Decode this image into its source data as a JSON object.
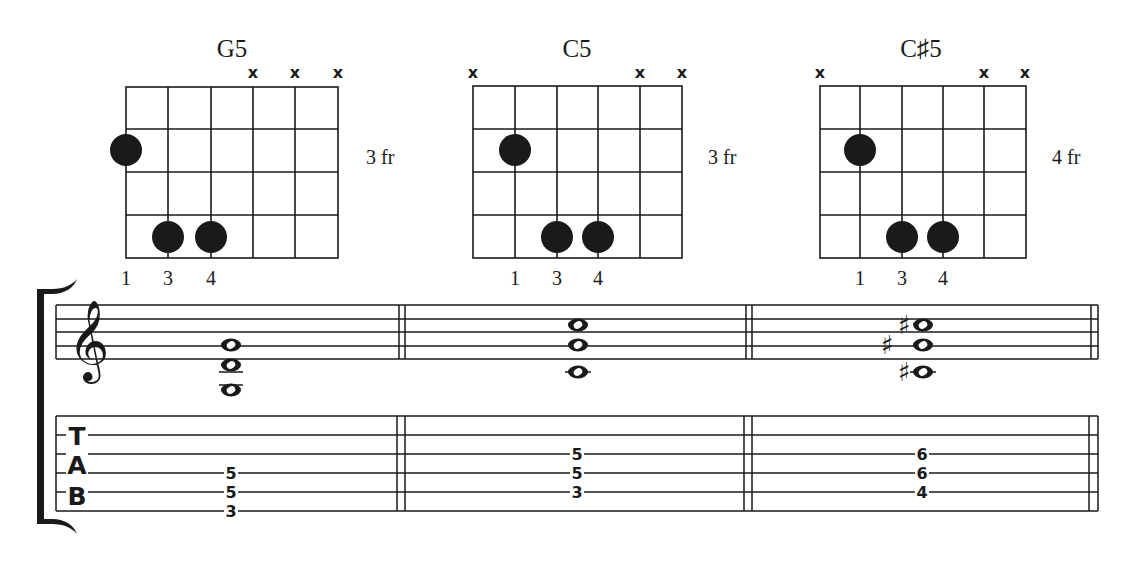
{
  "chords": [
    {
      "name": "G5",
      "fret_label": "3 fr",
      "muted_strings": [
        4,
        5,
        6
      ],
      "dots": [
        {
          "string": 1,
          "fret": 2
        },
        {
          "string": 2,
          "fret": 4
        },
        {
          "string": 3,
          "fret": 4
        }
      ],
      "fingers": [
        {
          "string": 1,
          "label": "1"
        },
        {
          "string": 2,
          "label": "3"
        },
        {
          "string": 3,
          "label": "4"
        }
      ],
      "staff_notes": [
        {
          "pitch": "G4",
          "sharp": false
        },
        {
          "pitch": "D4",
          "sharp": false
        },
        {
          "pitch": "G3",
          "sharp": false
        }
      ],
      "tab": [
        {
          "line": 4,
          "fret": "5"
        },
        {
          "line": 5,
          "fret": "5"
        },
        {
          "line": 6,
          "fret": "3"
        }
      ]
    },
    {
      "name": "C5",
      "fret_label": "3 fr",
      "muted_strings": [
        1,
        5,
        6
      ],
      "dots": [
        {
          "string": 2,
          "fret": 2
        },
        {
          "string": 3,
          "fret": 4
        },
        {
          "string": 4,
          "fret": 4
        }
      ],
      "fingers": [
        {
          "string": 2,
          "label": "1"
        },
        {
          "string": 3,
          "label": "3"
        },
        {
          "string": 4,
          "label": "4"
        }
      ],
      "staff_notes": [
        {
          "pitch": "C5",
          "sharp": false
        },
        {
          "pitch": "G4",
          "sharp": false
        },
        {
          "pitch": "C4",
          "sharp": false
        }
      ],
      "tab": [
        {
          "line": 3,
          "fret": "5"
        },
        {
          "line": 4,
          "fret": "5"
        },
        {
          "line": 5,
          "fret": "3"
        }
      ]
    },
    {
      "name": "C♯5",
      "fret_label": "4 fr",
      "muted_strings": [
        1,
        5,
        6
      ],
      "dots": [
        {
          "string": 2,
          "fret": 2
        },
        {
          "string": 3,
          "fret": 4
        },
        {
          "string": 4,
          "fret": 4
        }
      ],
      "fingers": [
        {
          "string": 2,
          "label": "1"
        },
        {
          "string": 3,
          "label": "3"
        },
        {
          "string": 4,
          "label": "4"
        }
      ],
      "staff_notes": [
        {
          "pitch": "C#5",
          "sharp": true
        },
        {
          "pitch": "G#4",
          "sharp": true
        },
        {
          "pitch": "C#4",
          "sharp": true
        }
      ],
      "tab": [
        {
          "line": 3,
          "fret": "6"
        },
        {
          "line": 4,
          "fret": "6"
        },
        {
          "line": 5,
          "fret": "4"
        }
      ]
    }
  ],
  "labels": {
    "mute": "x",
    "tab_t": "T",
    "tab_a": "A",
    "tab_b": "B",
    "treble_clef": "𝄞",
    "sharp": "♯",
    "c0": {
      "title": "G5",
      "fret": "3 fr",
      "f1": "1",
      "f2": "3",
      "f3": "4",
      "t1": "5",
      "t2": "5",
      "t3": "3"
    },
    "c1": {
      "title": "C5",
      "fret": "3 fr",
      "f1": "1",
      "f2": "3",
      "f3": "4",
      "t1": "5",
      "t2": "5",
      "t3": "3"
    },
    "c2": {
      "title": "C♯5",
      "fret": "4 fr",
      "f1": "1",
      "f2": "3",
      "f3": "4",
      "t1": "6",
      "t2": "6",
      "t3": "4"
    }
  },
  "colors": {
    "ink": "#1a1a1a",
    "paper": "#ffffff"
  }
}
